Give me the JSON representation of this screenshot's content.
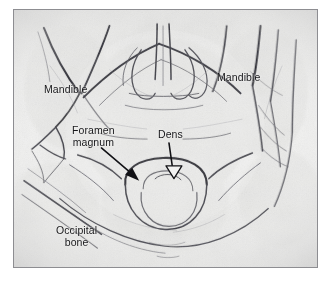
{
  "figure": {
    "kind": "radiograph",
    "modality_description": "Axial view radiograph of the skull base and upper cervical spine",
    "frame_border_color": "#8d8d91",
    "page_background": "#ffffff",
    "film_background": "#f4f4f3",
    "annotation_text_color": "#17171a"
  },
  "annotations": {
    "labels": [
      {
        "id": "mandible-left",
        "text": "Mandible",
        "lines": [
          "Mandible"
        ],
        "x": 30,
        "y": 74,
        "has_leader_arrow": false
      },
      {
        "id": "mandible-right",
        "text": "Mandible",
        "lines": [
          "Mandible"
        ],
        "x": 203,
        "y": 62,
        "has_leader_arrow": false
      },
      {
        "id": "foramen-magnum",
        "text": "Foramen magnum",
        "lines": [
          "Foramen",
          "magnum"
        ],
        "x": 58,
        "y": 115,
        "has_leader_arrow": true
      },
      {
        "id": "dens",
        "text": "Dens",
        "lines": [
          "Dens"
        ],
        "x": 144,
        "y": 119,
        "has_leader_arrow": true
      },
      {
        "id": "occipital-bone",
        "text": "Occipital bone",
        "lines": [
          "Occipital",
          "bone"
        ],
        "x": 42,
        "y": 215,
        "has_leader_arrow": false
      }
    ],
    "arrows": [
      {
        "id": "foramen-magnum-arrow",
        "points_to": "Foramen magnum",
        "style": "solid-filled",
        "from_x": 90,
        "from_y": 140,
        "to_x": 128,
        "to_y": 172,
        "color": "#111115"
      },
      {
        "id": "dens-arrow",
        "points_to": "Dens",
        "style": "hollow-outline",
        "from_x": 158,
        "from_y": 135,
        "to_x": 160,
        "to_y": 170,
        "color": "#111115"
      }
    ]
  },
  "structures": [
    "Mandible (left ramus)",
    "Mandible (right ramus)",
    "Foramen magnum",
    "Dens (odontoid process of C2)",
    "Occipital bone"
  ]
}
